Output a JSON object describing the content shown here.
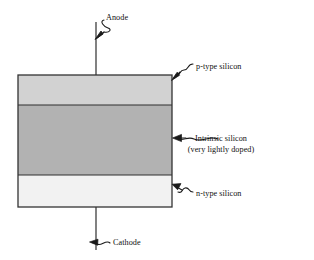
{
  "figure": {
    "background_color": "#ffffff",
    "line_color": "#1a1a1a"
  },
  "terminals": [
    {
      "key": "anode",
      "label": "Anode",
      "position": "top",
      "wire_x": 96,
      "wire_from_y": 22,
      "wire_to_y": 75,
      "arrow": "curved-arrow-down-left"
    },
    {
      "key": "cathode",
      "label": "Cathode",
      "position": "bottom",
      "wire_x": 96,
      "wire_from_y": 207,
      "wire_to_y": 250,
      "arrow": "curved-arrow-left"
    }
  ],
  "device": {
    "x": 18,
    "y": 75,
    "width": 154,
    "height": 132,
    "border_color": "#333333",
    "layers": [
      {
        "key": "p-type",
        "label": "p-type silicon",
        "fill": "#d2d2d2",
        "y": 75,
        "height": 30,
        "annotation": "squiggle-arrow-down-left"
      },
      {
        "key": "intrinsic",
        "label": "Intrinsic silicon",
        "sublabel": "(very lightly doped)",
        "fill": "#b2b2b2",
        "y": 105,
        "height": 70,
        "annotation": "squiggle-arrow-left"
      },
      {
        "key": "n-type",
        "label": "n-type silicon",
        "fill": "#f2f2f2",
        "y": 175,
        "height": 32,
        "annotation": "squiggle-arrow-up-left"
      }
    ]
  }
}
